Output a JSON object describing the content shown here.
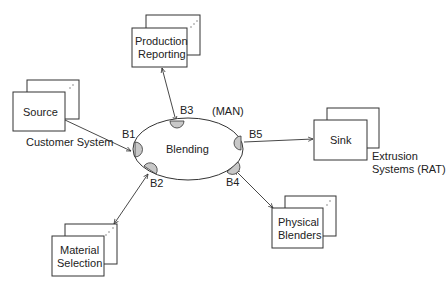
{
  "diagram": {
    "center": {
      "label": "Blending",
      "annotation": "(MAN)"
    },
    "ports": [
      {
        "id": "B1",
        "label": "B1"
      },
      {
        "id": "B2",
        "label": "B2"
      },
      {
        "id": "B3",
        "label": "B3"
      },
      {
        "id": "B4",
        "label": "B4"
      },
      {
        "id": "B5",
        "label": "B5"
      }
    ],
    "nodes": {
      "production_reporting": {
        "line1": "Production",
        "line2": "Reporting"
      },
      "source": {
        "label": "Source",
        "caption": "Customer System"
      },
      "sink": {
        "label": "Sink",
        "caption_line1": "Extrusion",
        "caption_line2": "Systems (RAT)"
      },
      "physical_blenders": {
        "line1": "Physical",
        "line2": "Blenders"
      },
      "material_selection": {
        "line1": "Material",
        "line2": "Selection"
      }
    },
    "connections": [
      {
        "from": "Source",
        "to": "B1",
        "direction": "to-port"
      },
      {
        "from": "Production Reporting",
        "to": "B3",
        "direction": "bidirectional"
      },
      {
        "from": "B5",
        "to": "Sink",
        "direction": "to-node"
      },
      {
        "from": "Physical Blenders",
        "to": "B4",
        "direction": "bidirectional"
      },
      {
        "from": "Material Selection",
        "to": "B2",
        "direction": "bidirectional"
      }
    ],
    "colors": {
      "stroke": "#333333",
      "port_fill": "#c8c8c8",
      "background": "#ffffff"
    }
  }
}
